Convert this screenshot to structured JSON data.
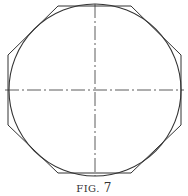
{
  "figure": {
    "caption_prefix": "FIG.",
    "caption_number": "7",
    "stroke_color": "#333333",
    "background": "#ffffff",
    "shapes": {
      "circle": {
        "cx": 95,
        "cy": 90,
        "r": 86
      },
      "octagon": "58,6 131,6 181,55 181,125 131,173 58,173 8,125 8,55",
      "centerline_horizontal": {
        "x1": 5,
        "y1": 90,
        "x2": 184,
        "y2": 90
      },
      "centerline_vertical": {
        "x1": 95,
        "y1": 4,
        "x2": 95,
        "y2": 176
      }
    }
  }
}
